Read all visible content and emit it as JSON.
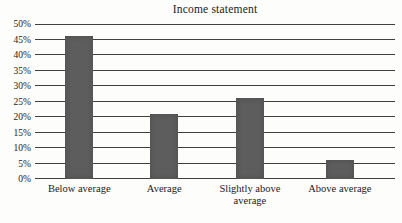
{
  "chart_data": {
    "type": "bar",
    "title": "Income statement",
    "categories": [
      "Below average",
      "Average",
      "Slightly above average",
      "Above average"
    ],
    "values": [
      46,
      21,
      26,
      6
    ],
    "value_unit": "%",
    "xlabel": "",
    "ylabel": "",
    "ylim": [
      0,
      50
    ],
    "ytick_step": 5,
    "ytick_labels": [
      "0%",
      "5%",
      "10%",
      "15%",
      "20%",
      "25%",
      "30%",
      "35%",
      "40%",
      "45%",
      "50%"
    ],
    "grid": "horizontal-only",
    "legend_position": "none",
    "bar_color": "#5d5d5d",
    "gridline_color": "#404040",
    "background_color": "#fdfdfb",
    "text_color": "#1b1b1b"
  }
}
